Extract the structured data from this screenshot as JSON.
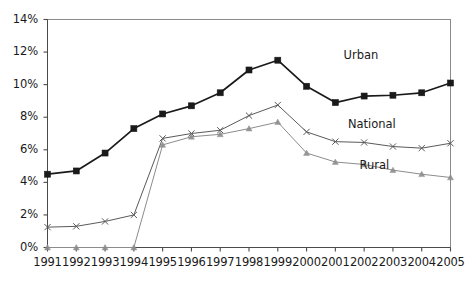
{
  "chart_data": {
    "type": "line",
    "title": "",
    "subtitle": "",
    "xlabel": "",
    "ylabel": "",
    "x": [
      1991,
      1992,
      1993,
      1994,
      1995,
      1996,
      1997,
      1998,
      1999,
      2000,
      2001,
      2002,
      2003,
      2004,
      2005
    ],
    "categories": [
      "1991",
      "1992",
      "1993",
      "1994",
      "1995",
      "1996",
      "1997",
      "1998",
      "1999",
      "2000",
      "2001",
      "2002",
      "2003",
      "2004",
      "2005"
    ],
    "xlim": [
      1991,
      2005
    ],
    "ylim": [
      0,
      14
    ],
    "ytick_values": [
      0,
      2,
      4,
      6,
      8,
      10,
      12,
      14
    ],
    "ytick_labels": [
      "0%",
      "2%",
      "4%",
      "6%",
      "8%",
      "10%",
      "12%",
      "14%"
    ],
    "grid": false,
    "legend_position": "inline-right",
    "series": [
      {
        "name": "Urban",
        "marker": "square",
        "color": "#1a1a1a",
        "values": [
          4.5,
          4.7,
          5.8,
          7.3,
          8.2,
          8.7,
          9.5,
          10.9,
          11.5,
          9.9,
          8.9,
          9.3,
          9.35,
          9.5,
          10.1
        ],
        "label_text": "Urban"
      },
      {
        "name": "National",
        "marker": "cross",
        "color": "#5a5a5a",
        "values": [
          1.25,
          1.3,
          1.6,
          2.0,
          6.7,
          7.0,
          7.2,
          8.1,
          8.75,
          7.1,
          6.5,
          6.45,
          6.2,
          6.1,
          6.4
        ],
        "label_text": "National"
      },
      {
        "name": "Rural",
        "marker": "triangle",
        "color": "#8c8c8c",
        "values": [
          0,
          0,
          0,
          0,
          6.3,
          6.8,
          6.95,
          7.3,
          7.7,
          5.8,
          5.25,
          5.1,
          4.75,
          4.5,
          4.3
        ],
        "label_text": "Rural"
      }
    ],
    "annotations": [
      {
        "text": "Urban",
        "x": 2002.05,
        "y": 11.75
      },
      {
        "text": "National",
        "x": 2002.2,
        "y": 7.5
      },
      {
        "text": "Rural",
        "x": 2002.6,
        "y": 5.0
      }
    ]
  },
  "axis": {
    "y_labels": [
      "14%",
      "12%",
      "10%",
      "8%",
      "6%",
      "4%",
      "2%",
      "0%"
    ],
    "x_labels": [
      "1991",
      "1992",
      "1993",
      "1994",
      "1995",
      "1996",
      "1997",
      "1998",
      "1999",
      "2000",
      "2001",
      "2002",
      "2003",
      "2004",
      "2005"
    ]
  },
  "colors": {
    "urban": "#1a1a1a",
    "national": "#5a5a5a",
    "rural": "#8c8c8c",
    "axis": "#4a4a4a",
    "background": "#ffffff"
  }
}
